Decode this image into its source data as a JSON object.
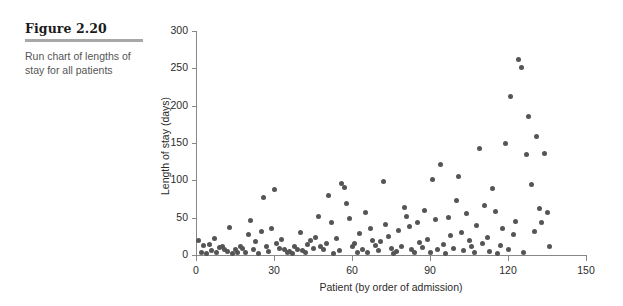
{
  "figure": {
    "label": "Figure 2.20",
    "caption": "Run chart of lengths of stay for all patients",
    "rule_color": "#a8a8a8"
  },
  "chart_data": {
    "type": "scatter",
    "title": "",
    "xlabel": "Patient (by order of admission)",
    "ylabel": "Length of stay (days)",
    "xlim": [
      0,
      150
    ],
    "ylim": [
      0,
      300
    ],
    "xticks": [
      0,
      30,
      60,
      90,
      120,
      150
    ],
    "yticks": [
      0,
      50,
      100,
      150,
      200,
      250,
      300
    ],
    "grid": false,
    "legend": null,
    "marker_color": "#555555",
    "axis_color": "#888888",
    "x": [
      1,
      2,
      3,
      4,
      5,
      6,
      7,
      8,
      9,
      10,
      11,
      12,
      13,
      14,
      15,
      16,
      17,
      18,
      19,
      20,
      21,
      22,
      23,
      24,
      25,
      26,
      27,
      28,
      29,
      30,
      31,
      32,
      33,
      34,
      35,
      36,
      37,
      38,
      39,
      40,
      41,
      42,
      43,
      44,
      45,
      46,
      47,
      48,
      49,
      50,
      51,
      52,
      53,
      54,
      55,
      56,
      57,
      58,
      59,
      60,
      61,
      62,
      63,
      64,
      65,
      66,
      67,
      68,
      69,
      70,
      71,
      72,
      73,
      74,
      75,
      76,
      77,
      78,
      79,
      80,
      81,
      82,
      83,
      84,
      85,
      86,
      87,
      88,
      89,
      90,
      91,
      92,
      93,
      94,
      95,
      96,
      97,
      98,
      99,
      100,
      101,
      102,
      103,
      104,
      105,
      106,
      107,
      108,
      109,
      110,
      111,
      112,
      113,
      114,
      115,
      116,
      117,
      118,
      119,
      120,
      121,
      122,
      123,
      124,
      125,
      126,
      127,
      128,
      129,
      130,
      131,
      132,
      133,
      134,
      135,
      136
    ],
    "y": [
      19,
      4,
      13,
      2,
      14,
      6,
      22,
      3,
      10,
      12,
      8,
      5,
      37,
      2,
      7,
      3,
      11,
      9,
      4,
      28,
      46,
      8,
      18,
      2,
      31,
      77,
      12,
      5,
      36,
      88,
      15,
      9,
      21,
      7,
      3,
      5,
      2,
      12,
      8,
      30,
      6,
      4,
      14,
      19,
      9,
      24,
      51,
      11,
      7,
      16,
      80,
      43,
      2,
      22,
      6,
      96,
      90,
      69,
      49,
      11,
      15,
      4,
      29,
      8,
      57,
      3,
      35,
      20,
      13,
      6,
      18,
      99,
      41,
      25,
      9,
      2,
      5,
      33,
      12,
      64,
      52,
      38,
      7,
      3,
      44,
      17,
      10,
      59,
      21,
      4,
      101,
      47,
      8,
      121,
      14,
      2,
      50,
      26,
      9,
      73,
      105,
      30,
      6,
      56,
      19,
      11,
      3,
      40,
      143,
      15,
      66,
      23,
      5,
      89,
      58,
      2,
      13,
      35,
      149,
      8,
      212,
      27,
      45,
      262,
      251,
      4,
      134,
      186,
      95,
      31,
      159,
      62,
      43,
      136,
      57,
      12
    ]
  },
  "plot_geometry": {
    "left_px": 196,
    "right_px": 586,
    "bottom_px": 255,
    "top_px": 31
  }
}
